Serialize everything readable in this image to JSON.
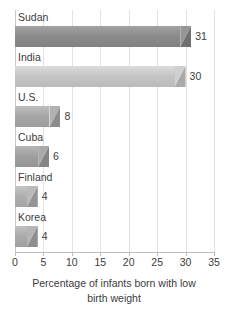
{
  "chart_data": {
    "type": "bar",
    "orientation": "horizontal",
    "title": "",
    "xlabel": "Percentage of infants born with low birth weight",
    "xlabel_lines": [
      "Percentage of infants born with low",
      "birth weight"
    ],
    "ylabel": "",
    "categories": [
      "Sudan",
      "India",
      "U.S.",
      "Cuba",
      "Finland",
      "Korea"
    ],
    "values": [
      31,
      30,
      8,
      6,
      4,
      4
    ],
    "value_labels": [
      "31",
      "30",
      "8",
      "6",
      "4",
      "4"
    ],
    "xlim": [
      0,
      35
    ],
    "xticks": [
      0,
      5,
      10,
      15,
      20,
      25,
      30,
      35
    ],
    "xtick_labels": [
      "0",
      "5",
      "10",
      "15",
      "20",
      "25",
      "30",
      "35"
    ],
    "grid": true,
    "grid_axis": "x",
    "legend": false,
    "bar_colors": [
      "#8c8c8c",
      "#c6c6c6",
      "#a8a8a8",
      "#a0a0a0",
      "#b0b0b0",
      "#ababab"
    ],
    "colors": {
      "gridline": "#e2e2e2",
      "axis": "#bdbdbd",
      "text": "#3c3c3c",
      "background": "#ffffff"
    }
  }
}
